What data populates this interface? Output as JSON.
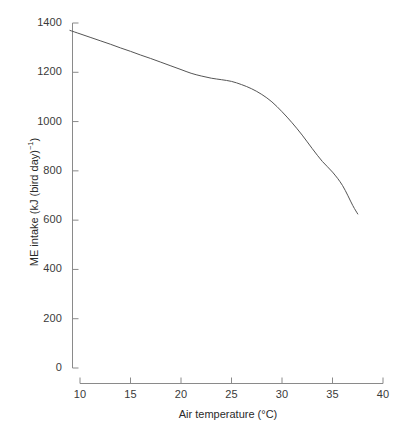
{
  "chart_data": {
    "type": "line",
    "title": "",
    "subtitle": "",
    "xlabel": "Air temperature (°C)",
    "ylabel": "ME intake (kJ (bird day)⁻¹)",
    "xlim": [
      8.5,
      40
    ],
    "ylim": [
      0,
      1400
    ],
    "xticks": [
      10,
      15,
      20,
      25,
      30,
      35,
      40
    ],
    "xticklabels": [
      "10",
      "15",
      "20",
      "25",
      "30",
      "35",
      "40"
    ],
    "yticks": [
      0,
      200,
      400,
      600,
      800,
      1000,
      1200,
      1400
    ],
    "yticklabels": [
      "0",
      "200",
      "400",
      "600",
      "800",
      "1000",
      "1200",
      "1400"
    ],
    "grid": false,
    "legend": null,
    "legend_position": "none",
    "line_color": "#555555",
    "line_width": 1,
    "axis_color": "#8a8a8a",
    "background_color": "#ffffff",
    "series": [
      {
        "name": "ME intake",
        "x": [
          9.0,
          10.0,
          11.0,
          12.0,
          13.0,
          14.0,
          15.0,
          16.0,
          17.0,
          18.0,
          19.0,
          20.0,
          21.0,
          22.0,
          23.0,
          24.0,
          25.0,
          26.0,
          27.0,
          28.0,
          29.0,
          30.0,
          31.0,
          32.0,
          33.0,
          34.0,
          35.0,
          36.0,
          37.0,
          37.5
        ],
        "y": [
          1370,
          1356,
          1342,
          1328,
          1314,
          1299,
          1285,
          1270,
          1256,
          1241,
          1226,
          1211,
          1196,
          1185,
          1176,
          1170,
          1163,
          1150,
          1133,
          1110,
          1080,
          1040,
          995,
          945,
          890,
          838,
          795,
          740,
          660,
          625
        ]
      }
    ],
    "annotations": []
  },
  "axis_titles": {
    "y_prefix": "ME intake (kJ (bird day)",
    "y_superscript": "−1",
    "y_suffix": ")",
    "x_full": "Air temperature (°C)"
  }
}
